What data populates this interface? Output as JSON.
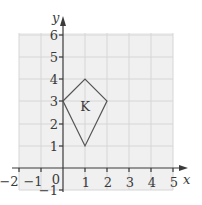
{
  "diagram": {
    "shape_label": "K",
    "x_axis": {
      "label": "x",
      "min": -2,
      "max": 5,
      "ticks": [
        "-2",
        "-1",
        "0",
        "1",
        "2",
        "3",
        "4",
        "5"
      ]
    },
    "y_axis": {
      "label": "y",
      "min": -1,
      "max": 6,
      "ticks": [
        "-1",
        "1",
        "2",
        "3",
        "4",
        "5",
        "6"
      ]
    },
    "origin_label": "0",
    "shape_vertices": [
      [
        0,
        3
      ],
      [
        1,
        4
      ],
      [
        2,
        3
      ],
      [
        1,
        1
      ]
    ],
    "colors": {
      "grid_bg": "#f0f0f0",
      "grid_line": "#d8d8d8",
      "axis": "#3a3a3a",
      "shape": "#555555"
    }
  }
}
